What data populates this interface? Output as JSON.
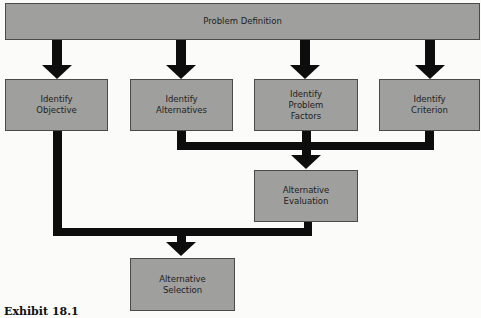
{
  "diagram": {
    "top": {
      "label": "Problem Definition"
    },
    "row2": [
      {
        "label": "Identify\nObjective"
      },
      {
        "label": "Identify\nAlternatives"
      },
      {
        "label": "Identify\nProblem\nFactors"
      },
      {
        "label": "Identify\nCriterion"
      }
    ],
    "evaluation": {
      "label": "Alternative\nEvaluation"
    },
    "selection": {
      "label": "Alternative\nSelection"
    },
    "colors": {
      "box_fill": "#9f9f9d",
      "arrow": "#0d0d0d",
      "background": "#fbfbfa"
    }
  },
  "caption": "Exhibit 18.1"
}
